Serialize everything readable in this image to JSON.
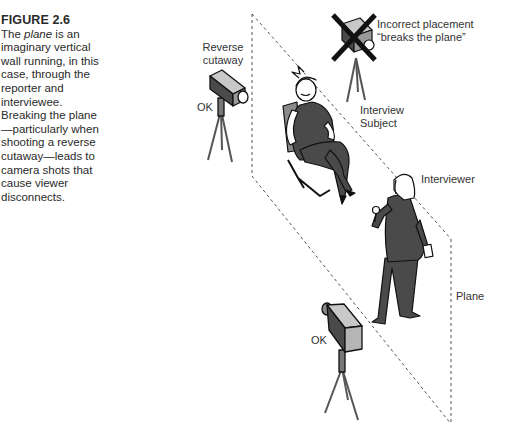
{
  "caption": {
    "figure_label": "FIGURE 2.6",
    "text_before_italic": "The ",
    "italic_term": "plane",
    "text_after_italic": " is an imaginary vertical wall running, in this case, through the reporter and interviewee. Breaking the plane—particularly when shooting a reverse cutaway—leads to camera shots that cause viewer disconnects."
  },
  "labels": {
    "reverse_cutaway_line1": "Reverse",
    "reverse_cutaway_line2": "cutaway",
    "ok_top": "OK",
    "incorrect_line1": "Incorrect placement",
    "incorrect_line2": "“breaks the plane”",
    "interview_subject_line1": "Interview",
    "interview_subject_line2": "Subject",
    "interviewer": "Interviewer",
    "plane": "Plane",
    "ok_bottom": "OK"
  },
  "colors": {
    "figure_dark": "#4a4a4a",
    "figure_mid": "#8a8a8a",
    "figure_light": "#c8c8c8",
    "line": "#111111",
    "dash": "#555555"
  }
}
